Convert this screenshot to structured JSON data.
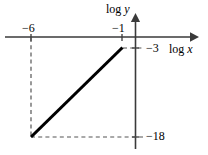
{
  "figure": {
    "title": "",
    "axes": {
      "x_axis_label": "log x",
      "y_axis_label": "log y"
    },
    "tick_labels": {
      "x_tick_1": "−6",
      "x_tick_2": "−1",
      "y_tick_1": "−3",
      "y_tick_2": "−18"
    }
  },
  "chart_data": {
    "type": "line",
    "title": "",
    "xlabel": "log x",
    "ylabel": "log y",
    "x": [
      -6,
      -1
    ],
    "y": [
      -18,
      -3
    ],
    "series": [
      {
        "name": "log y vs log x",
        "x": [
          -6,
          -1
        ],
        "values": [
          -18,
          -3
        ],
        "style": "solid",
        "color": "#000000"
      }
    ],
    "xticks": [
      -6,
      -1
    ],
    "xticklabels": [
      "−6",
      "−1"
    ],
    "yticks": [
      -18,
      -3
    ],
    "yticklabels": [
      "−18",
      "−3"
    ],
    "xlim": [
      -7.4,
      0.9
    ],
    "ylim": [
      -20.2,
      1.2
    ],
    "grid": false,
    "legend": null,
    "annotations": [
      {
        "type": "dashed-guide",
        "description": "vertical dashed line from x-axis at log x = -6 down to point (-6, -18)"
      },
      {
        "type": "dashed-guide",
        "description": "horizontal dashed line from point (-6, -18) right to y-axis tick -18"
      },
      {
        "type": "dashed-guide",
        "description": "horizontal dashed line from point (-1, -3) right to y-axis tick -3"
      }
    ],
    "axis_arrows": {
      "x": "right",
      "y": "up"
    }
  },
  "colors": {
    "line": "#000000",
    "axis": "#3a3a3a",
    "dashed": "#555555",
    "background": "#ffffff"
  }
}
